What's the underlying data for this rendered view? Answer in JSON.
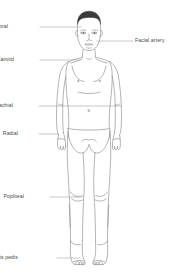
{
  "diagram": {
    "background_color": "#ffffff",
    "outline_color": "#8c8c8c",
    "hair_color": "#3a3a3a",
    "leader_line_color": "#9a9a9a",
    "label_color": "#4a4a4a"
  },
  "labels": [
    {
      "id": "temporal",
      "text": "Temporal",
      "side": "left",
      "text_x": 8,
      "text_y": 27,
      "leader_start_x": 40,
      "leader_start_y": 27,
      "leader_end_x": 81,
      "leader_end_y": 27
    },
    {
      "id": "facial-artery",
      "text": "Facial artery",
      "side": "right",
      "text_x": 135,
      "text_y": 41,
      "leader_start_x": 133,
      "leader_start_y": 41,
      "leader_end_x": 97,
      "leader_end_y": 41
    },
    {
      "id": "carotid",
      "text": "Carotid",
      "side": "left",
      "text_x": 14,
      "text_y": 60,
      "leader_start_x": 40,
      "leader_start_y": 60,
      "leader_end_x": 80,
      "leader_end_y": 60
    },
    {
      "id": "brachial",
      "text": "Brachial",
      "side": "left",
      "text_x": 13,
      "text_y": 106,
      "leader_start_x": 39,
      "leader_start_y": 106,
      "leader_end_x": 121,
      "leader_end_y": 106
    },
    {
      "id": "radial",
      "text": "Radial",
      "side": "left",
      "text_x": 18,
      "text_y": 134,
      "leader_start_x": 39,
      "leader_start_y": 134,
      "leader_end_x": 59,
      "leader_end_y": 134
    },
    {
      "id": "popliteal",
      "text": "Popliteal",
      "side": "left",
      "text_x": 24,
      "text_y": 197,
      "leader_start_x": 50,
      "leader_start_y": 197,
      "leader_end_x": 83,
      "leader_end_y": 197
    },
    {
      "id": "dorsalis-pedis",
      "text": "Dorsalis pedis",
      "side": "left",
      "text_x": 18,
      "text_y": 258,
      "leader_start_x": 57,
      "leader_start_y": 258,
      "leader_end_x": 80,
      "leader_end_y": 258
    }
  ]
}
